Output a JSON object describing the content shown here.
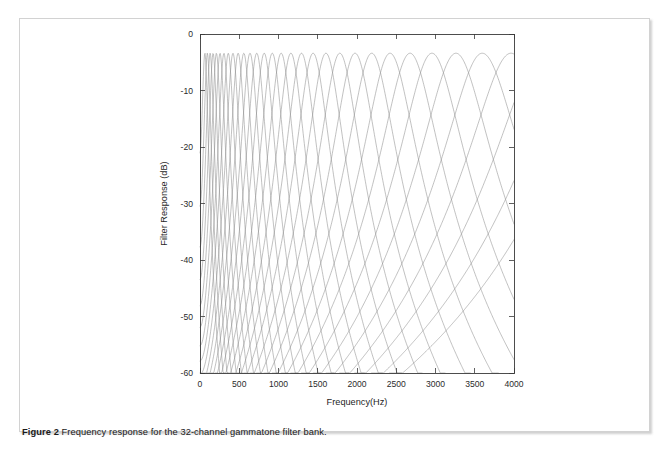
{
  "caption": {
    "label": "Figure 2",
    "text": "Frequency response for the 32-channel gammatone filter bank."
  },
  "chart_data": {
    "type": "line",
    "title": "",
    "xlabel": "Frequency(Hz)",
    "ylabel": "Filter Response (dB)",
    "xlim": [
      0,
      4000
    ],
    "ylim": [
      -60,
      0
    ],
    "xticks": [
      0,
      500,
      1000,
      1500,
      2000,
      2500,
      3000,
      3500,
      4000
    ],
    "xticklabels": [
      "0",
      "500",
      "1000",
      "1500",
      "2000",
      "2500",
      "3000",
      "3500",
      "4000"
    ],
    "yticks": [
      0,
      -10,
      -20,
      -30,
      -40,
      -50,
      -60
    ],
    "yticklabels": [
      "0",
      "-10",
      "-20",
      "-30",
      "-40",
      "-50",
      "-60"
    ],
    "grid": false,
    "legend": null,
    "n_channels": 32,
    "peak_gain_db": -3.4,
    "line_color": "#8e8e8e",
    "axis_color": "#3a3a3a",
    "gammatone_order": 4,
    "center_frequencies_hz": [
      62,
      94,
      129,
      167,
      209,
      255,
      305,
      360,
      420,
      486,
      558,
      637,
      723,
      818,
      921,
      1034,
      1158,
      1293,
      1441,
      1604,
      1781,
      1975,
      2188,
      2421,
      2676,
      2955,
      3261,
      3596,
      3962,
      4363,
      4802,
      5283
    ],
    "erb_bandwidths_hz": [
      35.7,
      38.6,
      41.8,
      45.2,
      49.1,
      53.3,
      57.8,
      62.9,
      68.4,
      74.4,
      81.0,
      88.3,
      96.2,
      104.9,
      114.5,
      125.0,
      136.4,
      149.0,
      162.9,
      178.0,
      194.7,
      213.0,
      233.0,
      255.0,
      279.0,
      305.5,
      334.5,
      366.4,
      401.4,
      439.8,
      482.1,
      528.4
    ]
  },
  "colors": {
    "page_background": "#ffffff",
    "figure_border": "#d2d2d2",
    "curve": "#8e8e8e",
    "axis": "#3a3a3a",
    "caption_text": "#1a1a1a"
  }
}
